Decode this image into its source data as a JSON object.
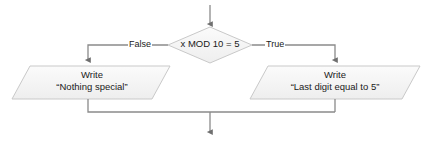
{
  "diagram": {
    "type": "flowchart",
    "background_color": "#ffffff",
    "shape_fill": "#f4f4f4",
    "shape_stroke": "#c9c9c9",
    "connector_color": "#8a8a8a",
    "text_color": "#1a1a1a",
    "entry_arrow": {
      "name": "entry-arrow",
      "direction": "down"
    },
    "decision": {
      "name": "decision-diamond",
      "condition": "x MOD 10 = 5"
    },
    "branches": [
      {
        "name": "false-branch",
        "label": "False",
        "side": "left"
      },
      {
        "name": "true-branch",
        "label": "True",
        "side": "right"
      }
    ],
    "processes": [
      {
        "name": "process-false",
        "side": "left",
        "shape": "parallelogram",
        "line1": "Write",
        "line2": "“Nothing special”"
      },
      {
        "name": "process-true",
        "side": "right",
        "shape": "parallelogram",
        "line1": "Write",
        "line2": "“Last digit equal to 5”"
      }
    ],
    "exit_arrow": {
      "name": "exit-arrow",
      "direction": "down"
    }
  }
}
